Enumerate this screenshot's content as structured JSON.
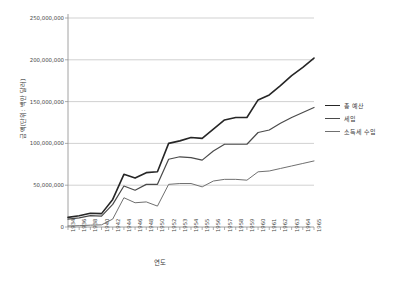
{
  "chart_data": {
    "type": "line",
    "title": "",
    "xlabel": "연도",
    "ylabel": "금액(단위: 백만 달러)",
    "grid": true,
    "legend_position": "right",
    "ylim": [
      0,
      250000000
    ],
    "yticks": [
      0,
      50000000,
      100000000,
      150000000,
      200000000,
      250000000
    ],
    "ytick_labels": [
      "0",
      "50,000,000",
      "100,000,000",
      "150,000,000",
      "200,000,000",
      "250,000,000"
    ],
    "categories": [
      "1934",
      "1936",
      "1938",
      "1940",
      "1942",
      "1944",
      "1946",
      "1948",
      "1950",
      "1952",
      "1953",
      "1954",
      "1955",
      "1956",
      "1957",
      "1958",
      "1959",
      "1960",
      "1961",
      "1962",
      "1963",
      "1964",
      "1965"
    ],
    "series": [
      {
        "name": "총 예산",
        "color": "#262626",
        "width": 1.6,
        "values": [
          11500000,
          13500000,
          16500000,
          16000000,
          33000000,
          63000000,
          58500000,
          65000000,
          66000000,
          100000000,
          103000000,
          107000000,
          106000000,
          117000000,
          128000000,
          131000000,
          131000000,
          152000000,
          158000000,
          169000000,
          181000000,
          191000000,
          202000000
        ]
      },
      {
        "name": "세입",
        "color": "#4a4a4a",
        "width": 1.2,
        "values": [
          9500000,
          11000000,
          13500000,
          13000000,
          27000000,
          49000000,
          44000000,
          51000000,
          51000000,
          81000000,
          84000000,
          83000000,
          80000000,
          91000000,
          99000000,
          99000000,
          99000000,
          113000000,
          116000000,
          124000000,
          131000000,
          137000000,
          143000000
        ]
      },
      {
        "name": "소득세 수입",
        "color": "#707070",
        "width": 1.0,
        "values": [
          1200000,
          1600000,
          2200000,
          2600000,
          9500000,
          35000000,
          29000000,
          30000000,
          25000000,
          51000000,
          52000000,
          52000000,
          48000000,
          55000000,
          57000000,
          57000000,
          56000000,
          66000000,
          67000000,
          70000000,
          73000000,
          76000000,
          79000000
        ]
      }
    ]
  },
  "legend": {
    "items": [
      {
        "label": "총 예산"
      },
      {
        "label": "세입"
      },
      {
        "label": "소득세 수입"
      }
    ]
  }
}
